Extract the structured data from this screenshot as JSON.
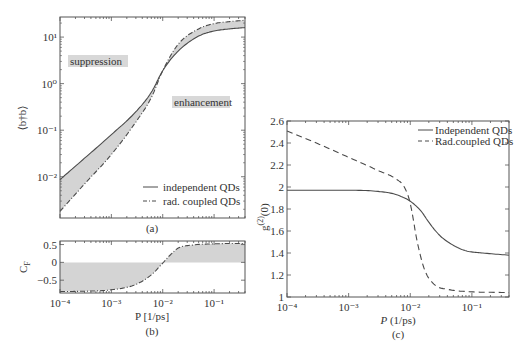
{
  "chart_data": [
    {
      "id": "a",
      "type": "line",
      "panel_label": "(a)",
      "title": "",
      "xlabel": "",
      "ylabel": "⟨b†b⟩",
      "xscale": "log",
      "yscale": "log",
      "xlim": [
        0.0001,
        0.4
      ],
      "ylim": [
        0.0013,
        27
      ],
      "yticks": [
        {
          "v": 10,
          "label": "10¹"
        },
        {
          "v": 1,
          "label": "10⁰"
        },
        {
          "v": 0.1,
          "label": "10⁻¹"
        },
        {
          "v": 0.01,
          "label": "10⁻²"
        }
      ],
      "annotations": [
        {
          "text": "suppression",
          "x": 0.00015,
          "y": 3.2
        },
        {
          "text": "enhancement",
          "x": 0.013,
          "y": 0.55
        }
      ],
      "fill_between": true,
      "legend": {
        "position": "lower right",
        "entries": [
          "independent QDs",
          "rad. coupled QDs"
        ]
      },
      "series": [
        {
          "name": "independent QDs",
          "style": "solid",
          "x": [
            0.0001,
            0.0003,
            0.001,
            0.003,
            0.006,
            0.01,
            0.02,
            0.05,
            0.1,
            0.2,
            0.4
          ],
          "y": [
            0.0087,
            0.025,
            0.08,
            0.25,
            0.65,
            1.9,
            5.0,
            10.5,
            13.5,
            15.0,
            16.0
          ]
        },
        {
          "name": "rad. coupled QDs",
          "style": "dashdot",
          "x": [
            0.0001,
            0.0003,
            0.001,
            0.003,
            0.006,
            0.01,
            0.02,
            0.05,
            0.1,
            0.2,
            0.4
          ],
          "y": [
            0.0018,
            0.007,
            0.03,
            0.15,
            0.5,
            1.9,
            7.0,
            15.0,
            19.5,
            21.5,
            23.0
          ]
        }
      ]
    },
    {
      "id": "b",
      "type": "line",
      "panel_label": "(b)",
      "xlabel": "P [1/ps]",
      "ylabel": "C_F",
      "xscale": "log",
      "yscale": "linear",
      "xlim": [
        0.0001,
        0.4
      ],
      "ylim": [
        -0.86,
        0.6
      ],
      "xticks": [
        {
          "v": 0.0001,
          "label": "10⁻⁴"
        },
        {
          "v": 0.001,
          "label": "10⁻³"
        },
        {
          "v": 0.01,
          "label": "10⁻²"
        },
        {
          "v": 0.1,
          "label": "10⁻¹"
        }
      ],
      "yticks": [
        {
          "v": 0.5,
          "label": "0.5"
        },
        {
          "v": 0,
          "label": "0"
        },
        {
          "v": -0.5,
          "label": "−0.5"
        }
      ],
      "fill_to_zero": true,
      "series": [
        {
          "name": "C_F",
          "style": "dashdot",
          "x": [
            0.0001,
            0.0003,
            0.001,
            0.003,
            0.006,
            0.01,
            0.015,
            0.02,
            0.04,
            0.1,
            0.2,
            0.4
          ],
          "y": [
            -0.82,
            -0.81,
            -0.77,
            -0.62,
            -0.35,
            -0.02,
            0.25,
            0.4,
            0.49,
            0.52,
            0.53,
            0.53
          ]
        }
      ]
    },
    {
      "id": "c",
      "type": "line",
      "panel_label": "(c)",
      "xlabel": "P (1/ps)",
      "ylabel": "g⁽²⁾(0)",
      "xscale": "log",
      "yscale": "linear",
      "xlim": [
        0.0001,
        0.4
      ],
      "ylim": [
        1.0,
        2.6
      ],
      "xticks": [
        {
          "v": 0.0001,
          "label": "10⁻⁴"
        },
        {
          "v": 0.001,
          "label": "10⁻³"
        },
        {
          "v": 0.01,
          "label": "10⁻²"
        },
        {
          "v": 0.1,
          "label": "10⁻¹"
        }
      ],
      "yticks": [
        {
          "v": 2.6,
          "label": "2.6"
        },
        {
          "v": 2.4,
          "label": "2.4"
        },
        {
          "v": 2.2,
          "label": "2.2"
        },
        {
          "v": 2.0,
          "label": "2"
        },
        {
          "v": 1.8,
          "label": "1.8"
        },
        {
          "v": 1.6,
          "label": "1.6"
        },
        {
          "v": 1.4,
          "label": "1.4"
        },
        {
          "v": 1.2,
          "label": "1.2"
        },
        {
          "v": 1.0,
          "label": "1"
        }
      ],
      "legend": {
        "position": "upper right",
        "entries": [
          "Independent QDs",
          "Rad.coupled QDs"
        ]
      },
      "series": [
        {
          "name": "Independent QDs",
          "style": "solid",
          "x": [
            0.0001,
            0.0003,
            0.001,
            0.003,
            0.006,
            0.01,
            0.015,
            0.02,
            0.03,
            0.05,
            0.08,
            0.15,
            0.4
          ],
          "y": [
            1.97,
            1.97,
            1.97,
            1.96,
            1.93,
            1.87,
            1.78,
            1.68,
            1.56,
            1.47,
            1.42,
            1.4,
            1.38
          ]
        },
        {
          "name": "Rad.coupled QDs",
          "style": "dashed",
          "x": [
            0.0001,
            0.0003,
            0.001,
            0.003,
            0.006,
            0.008,
            0.01,
            0.013,
            0.017,
            0.025,
            0.04,
            0.08,
            0.4
          ],
          "y": [
            2.51,
            2.4,
            2.27,
            2.15,
            2.07,
            2.0,
            1.85,
            1.5,
            1.25,
            1.11,
            1.07,
            1.05,
            1.04
          ]
        }
      ]
    }
  ],
  "figure": {
    "panel_a_label": "(a)",
    "panel_b_label": "(b)",
    "panel_c_label": "(c)",
    "panel_a_ylabel": "⟨b†b⟩",
    "panel_b_ylabel": "C",
    "panel_b_ylabel_sub": "F",
    "panel_b_xlabel": "P [1/ps]",
    "panel_c_ylabel": "g",
    "panel_c_ylabel_sup": "(2)",
    "panel_c_ylabel_tail": "(0)",
    "panel_c_xlabel_italic": "P",
    "panel_c_xlabel_rest": " (1/ps)",
    "annotation_suppression": "suppression",
    "annotation_enhancement": "enhancement",
    "legend_a_solid": "independent QDs",
    "legend_a_dashed": "rad. coupled QDs",
    "legend_c_solid": "Independent QDs",
    "legend_c_dashed": "Rad.coupled QDs"
  },
  "colors": {
    "line": "#4a4a4a",
    "fill": "#d4d4d4",
    "annotation_bg": "#d8d8d8",
    "axis": "#555555"
  }
}
